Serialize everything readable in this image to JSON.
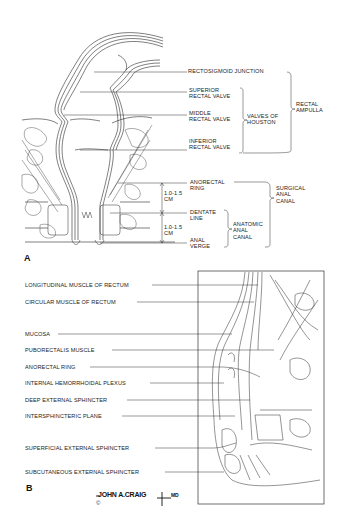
{
  "figure": {
    "panel_a": {
      "letter": "A",
      "labels": {
        "rectosigmoid_junction": "RECTOSIGMOID JUNCTION",
        "superior_rectal_valve_1": "SUPERIOR",
        "superior_rectal_valve_2": "RECTAL VALVE",
        "middle_rectal_valve_1": "MIDDLE",
        "middle_rectal_valve_2": "RECTAL VALVE",
        "inferior_rectal_valve_1": "INFERIOR",
        "inferior_rectal_valve_2": "RECTAL VALVE",
        "valves_of_houston_1": "VALVES OF",
        "valves_of_houston_2": "HOUSTON",
        "rectal_ampulla_1": "RECTAL",
        "rectal_ampulla_2": "AMPULLA",
        "anorectal_ring_1": "ANORECTAL",
        "anorectal_ring_2": "RING",
        "dentate_line_1": "DENTATE",
        "dentate_line_2": "LINE",
        "anal_verge_1": "ANAL",
        "anal_verge_2": "VERGE",
        "surgical_anal_canal_1": "SURGICAL",
        "surgical_anal_canal_2": "ANAL",
        "surgical_anal_canal_3": "CANAL",
        "anatomic_anal_canal_1": "ANATOMIC",
        "anatomic_anal_canal_2": "ANAL",
        "anatomic_anal_canal_3": "CANAL",
        "measure_upper_1": "1.0-1.5",
        "measure_upper_2": "CM",
        "measure_lower_1": "1.0-1.5",
        "measure_lower_2": "CM"
      }
    },
    "panel_b": {
      "letter": "B",
      "labels": [
        "LONGITUDINAL MUSCLE OF RECTUM",
        "CIRCULAR MUSCLE OF RECTUM",
        "MUCOSA",
        "PUBORECTALIS MUSCLE",
        "ANORECTAL RING",
        "INTERNAL HEMORRHOIDAL PLEXUS",
        "DEEP EXTERNAL SPHINCTER",
        "INTERSPHINCTERIC PLANE",
        "SUPERFICIAL EXTERNAL SPHINCTER",
        "SUBCUTANEOUS EXTERNAL SPHINCTER"
      ]
    },
    "signature": "JOHN A.CRAIG",
    "signature_suffix": "MD",
    "copyright": "©"
  }
}
